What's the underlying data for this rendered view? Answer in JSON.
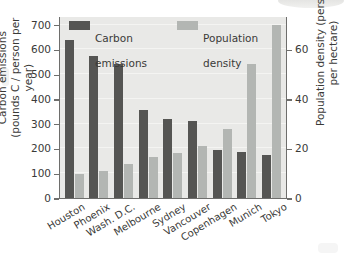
{
  "chart_data": {
    "type": "bar",
    "title": "",
    "subtitle": "",
    "categories": [
      "Houston",
      "Phoenix",
      "Wash. D.C.",
      "Melbourne",
      "Sydney",
      "Vancouver",
      "Copenhagen",
      "Munich",
      "Tokyo"
    ],
    "series": [
      {
        "name": "Carbon emissions",
        "axis": "left",
        "unit": "pounds C / person per year",
        "color": "#555553",
        "values": [
          640,
          572,
          542,
          356,
          318,
          310,
          192,
          184,
          174
        ]
      },
      {
        "name": "Population density",
        "axis": "right",
        "unit": "persons per hectare",
        "color": "#b3b6b3",
        "values": [
          9.5,
          11,
          13.7,
          16.5,
          18,
          21,
          28,
          54,
          70
        ]
      }
    ],
    "left_axis": {
      "label": "Carbon emissions\n(pounds C / person per year)",
      "label_line1": "Carbon emissions",
      "label_line2": "(pounds C / person per year)",
      "ticks": [
        0,
        100,
        200,
        300,
        400,
        500,
        600,
        700
      ],
      "ylim": [
        0,
        735
      ]
    },
    "right_axis": {
      "label": "Population density (persons per hectare)",
      "ticks": [
        0,
        20,
        40,
        60
      ],
      "ylim": [
        0,
        73.5
      ]
    },
    "xlabel": "",
    "grid": true,
    "legend": {
      "position": "top-inside",
      "entries": [
        {
          "label_line1": "Carbon",
          "label_line2": "emissions",
          "color": "#555553"
        },
        {
          "label_line1": "Population",
          "label_line2": "density",
          "color": "#b3b6b3"
        }
      ]
    },
    "plot_background": "#e9e9e7"
  }
}
